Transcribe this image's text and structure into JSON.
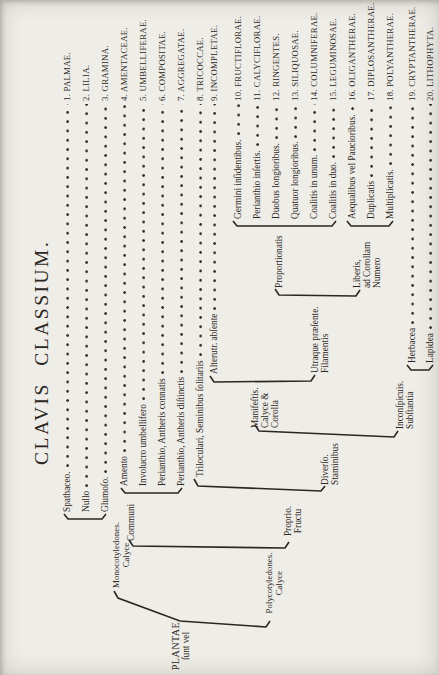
{
  "title": "CLAVIS CLASSIUM.",
  "colors": {
    "paper": "#efede8",
    "ink": "#2b2622"
  },
  "tree": {
    "root_line1": "PLANTAE",
    "root_line2": "ſunt vel",
    "monocotyledones": "Monocotyledones.\nCalyce",
    "polycotyledones": "Polycotyledones.\nCalyce",
    "communi": "Communi",
    "proprio": "Proprio.\nFructu",
    "diverso": "Diverſo.\nStaminibus",
    "manifestis": "Manifeſtis.\nCalyce &\nCorolla",
    "utraque": "Utraque præſente.\nFilamentis",
    "proportionatis": "Proportionatis",
    "liberis": "Liberis,\nad Corollam\nNumero",
    "inconspicuis": "Inconſpicuis.\nSubſtantia"
  },
  "rows": [
    {
      "condition": "Spathaceo.",
      "label": "1. PALMAE."
    },
    {
      "condition": "Nullo",
      "label": "2. LILIA."
    },
    {
      "condition": "Glumoſo.",
      "label": "3. GRAMINA."
    },
    {
      "condition": "Amento",
      "label": "4. AMENTACEAE."
    },
    {
      "condition": "Involucro umbellifero",
      "label": "5. UMBELLIFERAE."
    },
    {
      "condition": "Perianthio, Antheris connatis",
      "label": "6. COMPOSITAE."
    },
    {
      "condition": "Perianthio, Antheris diſtinctis",
      "label": "7. AGGREGATAE."
    },
    {
      "condition": "Triloculari, Seminibus ſolitariis",
      "label": "8. TRICOCCAE."
    },
    {
      "condition": "Alterutr. abſente",
      "label": "9. INCOMPLETAE."
    },
    {
      "condition": "Germini inſidentibus.",
      "label": "10. FRUCTIFLORAE."
    },
    {
      "condition": "Perianthio inſertis.",
      "label": "11. CALYCIFLORAE."
    },
    {
      "condition": "Duobus longioribus.",
      "label": "12. RINGENTES."
    },
    {
      "condition": "Quatuor longioribus.",
      "label": "13. SILIQUOSAE."
    },
    {
      "condition": "Coalitis in unum.",
      "label": "14. COLUMNIFERAE."
    },
    {
      "condition": "Coalitis in duo.",
      "label": "15. LEGUMINOSAE."
    },
    {
      "condition": "Aequalibus vel Paucioribus.",
      "label": "16. OLIGANTHERAE."
    },
    {
      "condition": "Duplicatis",
      "label": "17. DIPLOSANTHERAE."
    },
    {
      "condition": "Multiplicatis.",
      "label": "18. POLYANTHERAE."
    },
    {
      "condition": "Herbacea",
      "label": "19. CRYPTANTHERAE."
    },
    {
      "condition": "Lapidea",
      "label": "20. LITHOPHYTA."
    }
  ]
}
